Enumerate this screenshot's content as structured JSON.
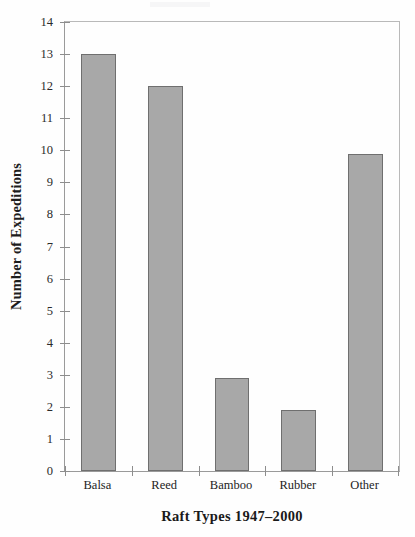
{
  "chart_data": {
    "type": "bar",
    "title": "",
    "subtitle": "",
    "xlabel": "Raft Types 1947–2000",
    "ylabel": "Number of Expeditions",
    "categories": [
      "Balsa",
      "Reed",
      "Bamboo",
      "Rubber",
      "Other"
    ],
    "values": [
      13,
      12,
      2.9,
      1.9,
      9.9
    ],
    "series": [
      {
        "name": "Number of Expeditions",
        "values": [
          13,
          12,
          2.9,
          1.9,
          9.9
        ]
      }
    ],
    "ylim": [
      0,
      14
    ],
    "xlim": [
      0,
      5
    ],
    "y_ticks": [
      0,
      1,
      2,
      3,
      4,
      5,
      6,
      7,
      8,
      9,
      10,
      11,
      12,
      13,
      14
    ],
    "y_tick_labels": [
      "0",
      "1",
      "2",
      "3",
      "4",
      "5",
      "6",
      "7",
      "8",
      "9",
      "10",
      "11",
      "12",
      "13",
      "14"
    ],
    "grid": false,
    "legend": false,
    "legend_position": "none",
    "bar_color": "#a8a8a8",
    "bar_edge_color": "#6f6f6f",
    "axis_color": "#9a9a9a",
    "background_color": "#fefefe",
    "text_color": "#1d1d1d",
    "bar_width_fraction": 0.52
  }
}
